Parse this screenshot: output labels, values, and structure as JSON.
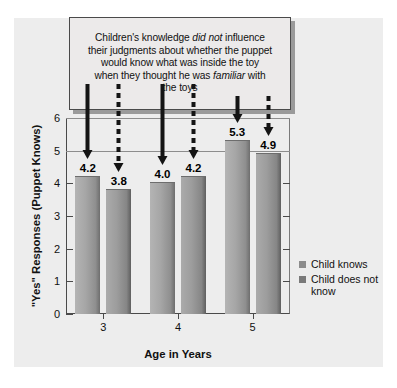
{
  "callout": {
    "line1_a": "Children's knowledge ",
    "line1_em": "did not",
    "line1_b": " influence",
    "line2": "their judgments about whether the puppet",
    "line3": "would know what was inside the toy",
    "line4_a": "when they thought he was ",
    "line4_em": "familiar",
    "line4_b": " with",
    "line5": "the toys"
  },
  "chart_data": {
    "type": "bar",
    "title": "",
    "xlabel": "Age in Years",
    "ylabel": "\"Yes\" Responses (Puppet Knows)",
    "categories": [
      "3",
      "4",
      "5"
    ],
    "ylim": [
      0,
      6
    ],
    "yticks": [
      "0",
      "1",
      "2",
      "3",
      "4",
      "5",
      "6"
    ],
    "grid": "horizontal-at-5-and-6",
    "legend_position": "right",
    "series": [
      {
        "name": "Child knows",
        "values": [
          4.2,
          4.0,
          5.3
        ],
        "labels": [
          "4.2",
          "4.0",
          "5.3"
        ],
        "color": "#a6a6a6",
        "arrow_style": "solid"
      },
      {
        "name": "Child does not know",
        "values": [
          3.8,
          4.2,
          4.9
        ],
        "labels": [
          "3.8",
          "4.2",
          "4.9"
        ],
        "color": "#9d9d9d",
        "arrow_style": "dashed"
      }
    ]
  },
  "legend": {
    "items": [
      {
        "label": "Child knows"
      },
      {
        "label": "Child does not know"
      }
    ]
  },
  "colors": {
    "panel": "#ededed",
    "bar_light": "#b4b4b4",
    "bar_dark": "#6e6e6e",
    "axis": "#4a4a4a",
    "arrow": "#141414"
  }
}
